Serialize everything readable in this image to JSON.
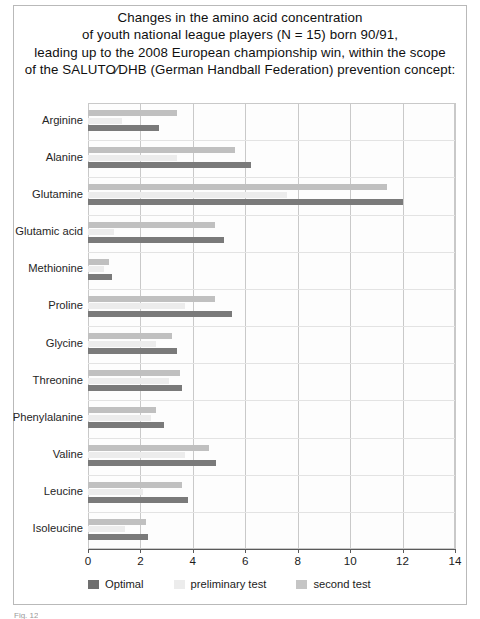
{
  "figure": {
    "title_lines": [
      "Changes in the amino acid concentration",
      "of youth national league players (N = 15) born 90/91,",
      "leading up to the 2008 European championship win, within the scope",
      "of the SALUTO∕DHB (German Handball Federation) prevention concept:"
    ],
    "caption": "Fig. 12"
  },
  "colors": {
    "optimal": "#7a7a7a",
    "preliminary_test": "#ececec",
    "second_test": "#c0c0c0",
    "grid": "#c9c9c9",
    "frame": "#b9b9b9",
    "axis": "#5a5a5a"
  },
  "chart_data": {
    "type": "bar",
    "orientation": "horizontal",
    "xlabel": "",
    "ylabel": "",
    "xlim": [
      0,
      14
    ],
    "xticks": [
      0,
      2,
      4,
      6,
      8,
      10,
      12,
      14
    ],
    "xticklabels": [
      "0",
      "2",
      "4",
      "6",
      "8",
      "10",
      "12",
      "14"
    ],
    "grid": true,
    "legend_position": "below-axis",
    "categories": [
      "Arginine",
      "Alanine",
      "Glutamine",
      "Glutamic acid",
      "Methionine",
      "Proline",
      "Glycine",
      "Threonine",
      "Phenylalanine",
      "Valine",
      "Leucine",
      "Isoleucine"
    ],
    "series": [
      {
        "name": "second test",
        "color": "#c0c0c0",
        "values": [
          3.4,
          5.6,
          11.4,
          4.85,
          0.8,
          4.85,
          3.2,
          3.5,
          2.6,
          4.6,
          3.6,
          2.2
        ]
      },
      {
        "name": "preliminary test",
        "color": "#ececec",
        "values": [
          1.3,
          3.4,
          7.6,
          1.0,
          0.6,
          3.7,
          2.6,
          3.1,
          2.4,
          3.7,
          2.1,
          1.4
        ]
      },
      {
        "name": "Optimal",
        "color": "#7a7a7a",
        "values": [
          2.7,
          6.2,
          12.0,
          5.2,
          0.9,
          5.5,
          3.4,
          3.6,
          2.9,
          4.9,
          3.8,
          2.3
        ]
      }
    ]
  },
  "legend": {
    "items": [
      {
        "label": "Optimal",
        "swatch": "optimal"
      },
      {
        "label": "preliminary test",
        "swatch": "prelim"
      },
      {
        "label": "second test",
        "swatch": "second"
      }
    ]
  }
}
